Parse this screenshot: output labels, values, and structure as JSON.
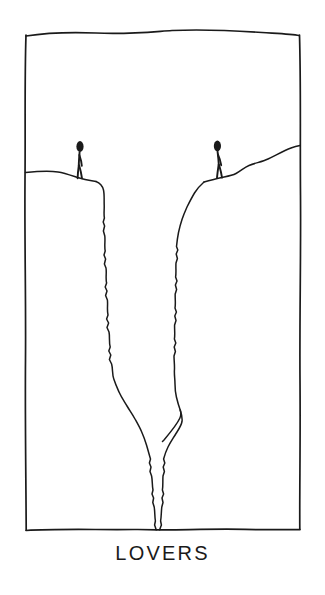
{
  "artwork": {
    "caption": "LOVERS",
    "medium": "pen-and-ink line drawing",
    "scene_description": "Two stick figures stand on opposite rims of a deep chasm that splits the ground between them",
    "colors": {
      "ink": "#1a1a1a",
      "paper": "#ffffff"
    },
    "frame": {
      "name": "hand-drawn-border",
      "left": 25,
      "top": 34,
      "right": 300,
      "bottom": 530
    },
    "figures": [
      {
        "id": "figure-left",
        "label": "left-standing-figure",
        "head_center_x": 80,
        "head_center_y": 146,
        "feet_y": 178,
        "facing": "right"
      },
      {
        "id": "figure-right",
        "label": "right-standing-figure",
        "head_center_x": 217,
        "head_center_y": 146,
        "feet_y": 177,
        "facing": "left"
      }
    ],
    "terrain": {
      "left_ground_label": "left-plateau-edge",
      "right_ground_label": "right-slope",
      "chasm_label": "chasm-crack",
      "chasm_bottom_x": 157,
      "chasm_bottom_y": 530
    }
  }
}
